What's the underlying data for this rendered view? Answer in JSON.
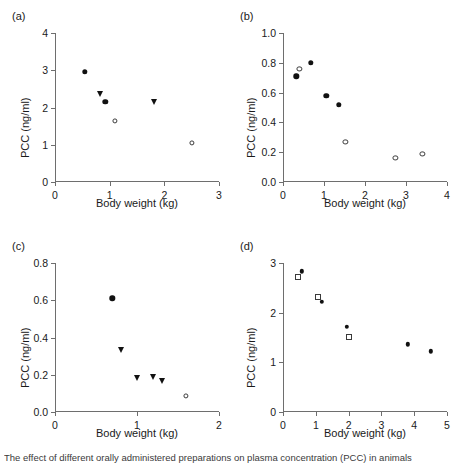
{
  "figure": {
    "width": 456,
    "height": 462,
    "background": "#ffffff",
    "axis_color": "#6e6e6e",
    "marker_color": "#111111",
    "caption": "The effect of different orally administered preparations on plasma concentration (PCC) in animals"
  },
  "axis_titles": {
    "x": "Body weight (kg)",
    "y": "PCC (ng/ml)"
  },
  "chart_data": [
    {
      "type": "scatter",
      "panel": "(a)",
      "title": "",
      "xlabel": "Body weight (kg)",
      "ylabel": "PCC (ng/ml)",
      "xlim": [
        0,
        3
      ],
      "ylim": [
        0,
        4
      ],
      "xticks": [
        0,
        1,
        2,
        3
      ],
      "xticklabels": [
        "0",
        "1",
        "2",
        "3"
      ],
      "yticks": [
        0,
        1,
        2,
        3,
        4
      ],
      "yticklabels": [
        "0",
        "1",
        "2",
        "3",
        "4"
      ],
      "grid": false,
      "legend": "none",
      "series": [
        {
          "name": "filled-circle",
          "marker": "filled-circle",
          "points": [
            {
              "x": 0.55,
              "y": 2.96
            },
            {
              "x": 0.92,
              "y": 2.15
            }
          ]
        },
        {
          "name": "filled-triangle",
          "marker": "filled-triangle-down",
          "points": [
            {
              "x": 0.83,
              "y": 2.37
            },
            {
              "x": 1.82,
              "y": 2.15
            }
          ]
        },
        {
          "name": "open-circle",
          "marker": "open-circle",
          "points": [
            {
              "x": 1.09,
              "y": 1.64
            },
            {
              "x": 2.5,
              "y": 1.04
            }
          ]
        }
      ]
    },
    {
      "type": "scatter",
      "panel": "(b)",
      "title": "",
      "xlabel": "Body weight (kg)",
      "ylabel": "PCC (ng/ml)",
      "xlim": [
        0,
        4
      ],
      "ylim": [
        0.0,
        1.0
      ],
      "xticks": [
        0,
        1,
        2,
        3,
        4
      ],
      "xticklabels": [
        "0",
        "1",
        "2",
        "3",
        "4"
      ],
      "yticks": [
        0.0,
        0.2,
        0.4,
        0.6,
        0.8,
        1.0
      ],
      "yticklabels": [
        "0.0",
        "0.2",
        "0.4",
        "0.6",
        "0.8",
        "1.0"
      ],
      "grid": false,
      "legend": "none",
      "series": [
        {
          "name": "filled-circle",
          "marker": "filled-circle",
          "points": [
            {
              "x": 0.32,
              "y": 0.71
            },
            {
              "x": 0.68,
              "y": 0.8
            },
            {
              "x": 1.06,
              "y": 0.58
            },
            {
              "x": 1.36,
              "y": 0.52
            }
          ]
        },
        {
          "name": "open-circle",
          "marker": "open-circle",
          "points": [
            {
              "x": 0.4,
              "y": 0.76
            },
            {
              "x": 1.52,
              "y": 0.27
            },
            {
              "x": 2.74,
              "y": 0.16
            },
            {
              "x": 3.4,
              "y": 0.19
            }
          ]
        }
      ]
    },
    {
      "type": "scatter",
      "panel": "(c)",
      "title": "",
      "xlabel": "Body weight (kg)",
      "ylabel": "PCC (ng/ml)",
      "xlim": [
        0,
        2
      ],
      "ylim": [
        0.0,
        0.8
      ],
      "xticks": [
        0,
        1,
        2
      ],
      "xticklabels": [
        "0",
        "1",
        "2"
      ],
      "yticks": [
        0.0,
        0.2,
        0.4,
        0.6,
        0.8
      ],
      "yticklabels": [
        "0.0",
        "0.2",
        "0.4",
        "0.6",
        "0.8"
      ],
      "grid": false,
      "legend": "none",
      "series": [
        {
          "name": "filled-circle",
          "marker": "filled-circle",
          "points": [
            {
              "x": 0.7,
              "y": 0.61
            }
          ]
        },
        {
          "name": "filled-triangle",
          "marker": "filled-triangle-down",
          "points": [
            {
              "x": 0.8,
              "y": 0.335
            },
            {
              "x": 1.0,
              "y": 0.185
            },
            {
              "x": 1.19,
              "y": 0.19
            },
            {
              "x": 1.3,
              "y": 0.165
            }
          ]
        },
        {
          "name": "open-circle",
          "marker": "open-circle",
          "points": [
            {
              "x": 1.6,
              "y": 0.085
            }
          ]
        }
      ]
    },
    {
      "type": "scatter",
      "panel": "(d)",
      "title": "",
      "xlabel": "Body weight (kg)",
      "ylabel": "PCC (ng/ml)",
      "xlim": [
        0,
        5
      ],
      "ylim": [
        0,
        3
      ],
      "xticks": [
        0,
        1,
        2,
        3,
        4,
        5
      ],
      "xticklabels": [
        "0",
        "1",
        "2",
        "3",
        "4",
        "5"
      ],
      "yticks": [
        0,
        1,
        2,
        3
      ],
      "yticklabels": [
        "0",
        "1",
        "2",
        "3"
      ],
      "grid": false,
      "legend": "none",
      "series": [
        {
          "name": "filled-circle",
          "marker": "small-filled-circle",
          "points": [
            {
              "x": 0.58,
              "y": 2.83
            },
            {
              "x": 1.18,
              "y": 2.22
            },
            {
              "x": 1.95,
              "y": 1.72
            },
            {
              "x": 3.8,
              "y": 1.36
            },
            {
              "x": 4.5,
              "y": 1.22
            }
          ]
        },
        {
          "name": "open-square",
          "marker": "open-square",
          "points": [
            {
              "x": 0.45,
              "y": 2.72
            },
            {
              "x": 1.08,
              "y": 2.32
            },
            {
              "x": 2.0,
              "y": 1.52
            }
          ]
        }
      ]
    }
  ],
  "panels": [
    {
      "label": "(a)"
    },
    {
      "label": "(b)"
    },
    {
      "label": "(c)"
    },
    {
      "label": "(d)"
    }
  ]
}
